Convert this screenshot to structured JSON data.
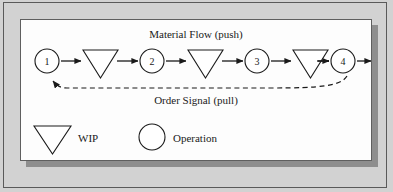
{
  "figure": {
    "title_top": "Material Flow (push)",
    "title_bottom": "Order Signal (pull)",
    "background_color": "#d2d2d2",
    "panel_color": "#fdfdfd",
    "shadow_color": "#8e8e8e",
    "line_color": "#1a1a1a"
  },
  "chain": {
    "operations": [
      {
        "id": "1",
        "label": "1"
      },
      {
        "id": "2",
        "label": "2"
      },
      {
        "id": "3",
        "label": "3"
      },
      {
        "id": "4",
        "label": "4"
      }
    ],
    "wip_buffers": [
      {
        "id": "wip-1"
      },
      {
        "id": "wip-2"
      },
      {
        "id": "wip-3"
      }
    ],
    "material_flow_direction": "left-to-right",
    "order_signal_direction": "right-to-left"
  },
  "legend": {
    "items": [
      {
        "symbol": "triangle-down",
        "label": "WIP"
      },
      {
        "symbol": "circle",
        "label": "Operation"
      }
    ]
  }
}
